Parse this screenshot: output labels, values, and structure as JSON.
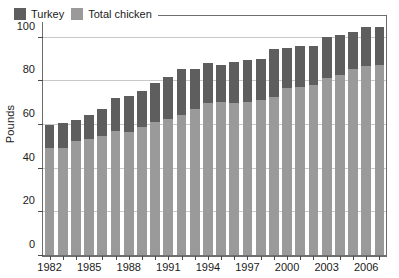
{
  "chart_data": {
    "type": "bar",
    "stacked": true,
    "title": "",
    "xlabel": "",
    "ylabel": "Pounds",
    "ylim": [
      0,
      110
    ],
    "yticks": [
      0,
      20,
      40,
      60,
      80,
      100
    ],
    "grid": true,
    "legend_position": "top-left",
    "categories": [
      "1982",
      "1983",
      "1984",
      "1985",
      "1986",
      "1987",
      "1988",
      "1989",
      "1990",
      "1991",
      "1992",
      "1993",
      "1994",
      "1995",
      "1996",
      "1997",
      "1998",
      "1999",
      "2000",
      "2001",
      "2002",
      "2003",
      "2004",
      "2005",
      "2006",
      "2007"
    ],
    "xtick_labels": [
      "1982",
      "1985",
      "1988",
      "1991",
      "1994",
      "1997",
      "2000",
      "2003",
      "2006"
    ],
    "series": [
      {
        "name": "Total chicken",
        "color": "#9a9a9a",
        "values": [
          49.5,
          49.5,
          52.8,
          53.5,
          54.8,
          57.5,
          57.0,
          59.0,
          61.5,
          63.0,
          64.5,
          67.5,
          70.0,
          70.5,
          70.0,
          70.5,
          71.5,
          72.8,
          76.8,
          77.5,
          78.3,
          81.5,
          83.0,
          85.8,
          87.0,
          87.5
        ]
      },
      {
        "name": "Turkey",
        "color": "#5e5e5e",
        "values": [
          10.5,
          11.3,
          9.6,
          11.0,
          12.5,
          14.8,
          16.5,
          16.8,
          17.8,
          19.0,
          21.0,
          18.0,
          18.5,
          17.0,
          19.0,
          19.3,
          18.8,
          22.0,
          18.7,
          18.8,
          18.0,
          19.0,
          18.5,
          17.0,
          18.0,
          17.5
        ]
      }
    ],
    "totals": [
      60.0,
      60.8,
      62.4,
      64.5,
      67.3,
      72.3,
      73.5,
      75.8,
      79.3,
      82.0,
      85.5,
      85.5,
      88.5,
      87.5,
      89.0,
      89.8,
      90.3,
      94.8,
      95.5,
      96.3,
      96.3,
      100.5,
      101.5,
      102.8,
      105.0,
      105.0
    ]
  },
  "legend": {
    "turkey_label": "Turkey",
    "chicken_label": "Total chicken"
  },
  "axis": {
    "y_title": "Pounds"
  }
}
